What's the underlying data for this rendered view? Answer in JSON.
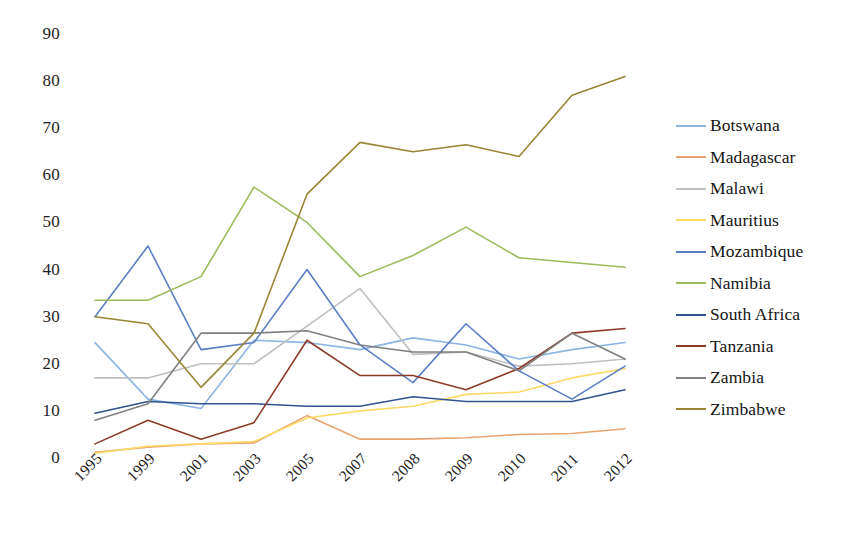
{
  "chart_data": {
    "type": "line",
    "title": "",
    "xlabel": "",
    "ylabel": "",
    "categories": [
      "1995",
      "1999",
      "2001",
      "2003",
      "2005",
      "2007",
      "2008",
      "2009",
      "2010",
      "2011",
      "2012"
    ],
    "ylim": [
      0,
      90
    ],
    "yticks": [
      0,
      10,
      20,
      30,
      40,
      50,
      60,
      70,
      80,
      90
    ],
    "grid": false,
    "legend_position": "right",
    "series": [
      {
        "name": "Botswana",
        "color": "#8db4e2",
        "values": [
          24.5,
          12.5,
          10.5,
          25,
          24.5,
          23,
          25.5,
          24,
          21,
          23,
          24.5
        ]
      },
      {
        "name": "Madagascar",
        "color": "#e8a470",
        "values": [
          1.2,
          2.3,
          3,
          3.2,
          9,
          4,
          4,
          4.3,
          5,
          5.2,
          6.2
        ]
      },
      {
        "name": "Malawi",
        "color": "#bfbfbf",
        "values": [
          17,
          17,
          20,
          20,
          28,
          36,
          22,
          22.5,
          19.5,
          20,
          21
        ]
      },
      {
        "name": "Mauritius",
        "color": "#ffd966",
        "values": [
          1,
          2.5,
          3,
          3.5,
          8.5,
          10,
          11,
          13.5,
          14,
          17,
          19
        ]
      },
      {
        "name": "Mozambique",
        "color": "#5a7fc4",
        "values": [
          30,
          45,
          23,
          24.5,
          40,
          24,
          16,
          28.5,
          18.5,
          12.5,
          19.5
        ]
      },
      {
        "name": "Namibia",
        "color": "#9bbb59",
        "values": [
          33.5,
          33.5,
          38.5,
          57.5,
          50,
          38.5,
          43,
          49,
          42.5,
          41.5,
          40.5
        ]
      },
      {
        "name": "South Africa",
        "color": "#31538f",
        "values": [
          9.5,
          12,
          11.5,
          11.5,
          11,
          11,
          13,
          12,
          12,
          12,
          14.5
        ]
      },
      {
        "name": "Tanzania",
        "color": "#8c3b28",
        "values": [
          3,
          8,
          4,
          7.5,
          25,
          17.5,
          17.5,
          14.5,
          19,
          26.5,
          27.5
        ]
      },
      {
        "name": "Zambia",
        "color": "#808080",
        "values": [
          8,
          11.5,
          26.5,
          26.5,
          27,
          24,
          22.5,
          22.5,
          18.5,
          26.5,
          21
        ]
      },
      {
        "name": "Zimbabwe",
        "color": "#9a8535",
        "values": [
          30,
          28.5,
          15,
          26.5,
          56,
          67,
          65,
          66.5,
          64,
          77,
          81
        ]
      }
    ]
  },
  "axes": {
    "y_tick_labels": [
      "90",
      "80",
      "70",
      "60",
      "50",
      "40",
      "30",
      "20",
      "10",
      "0"
    ],
    "x_tick_labels": [
      "1995",
      "1999",
      "2001",
      "2003",
      "2005",
      "2007",
      "2008",
      "2009",
      "2010",
      "2011",
      "2012"
    ]
  },
  "legend": {
    "items": [
      {
        "label": "Botswana",
        "color": "#8db4e2"
      },
      {
        "label": "Madagascar",
        "color": "#e8a470"
      },
      {
        "label": "Malawi",
        "color": "#bfbfbf"
      },
      {
        "label": "Mauritius",
        "color": "#ffd966"
      },
      {
        "label": "Mozambique",
        "color": "#5a7fc4"
      },
      {
        "label": "Namibia",
        "color": "#9bbb59"
      },
      {
        "label": "South Africa",
        "color": "#31538f"
      },
      {
        "label": "Tanzania",
        "color": "#8c3b28"
      },
      {
        "label": "Zambia",
        "color": "#808080"
      },
      {
        "label": "Zimbabwe",
        "color": "#9a8535"
      }
    ]
  }
}
